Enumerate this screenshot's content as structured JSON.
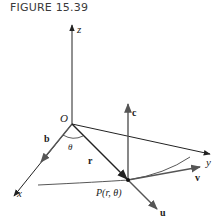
{
  "figure": {
    "title": "FIGURE 15.39",
    "labels": {
      "z_axis": "z",
      "y_axis": "y",
      "x_axis": "x",
      "origin": "O",
      "angle": "θ",
      "position_vector": "r",
      "vector_b": "b",
      "vector_c": "c",
      "vector_u": "u",
      "vector_v": "v",
      "point": "P(r, θ)"
    },
    "colors": {
      "axes": "#222222",
      "vectors": "#333333",
      "curve": "#444444",
      "text": "#222222"
    }
  }
}
